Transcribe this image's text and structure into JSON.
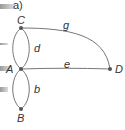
{
  "figure": {
    "part_label": "a)",
    "nodes": [
      {
        "id": "C",
        "label": "C"
      },
      {
        "id": "A",
        "label": "A"
      },
      {
        "id": "B",
        "label": "B"
      },
      {
        "id": "D",
        "label": "D"
      }
    ],
    "edges": [
      {
        "id": "g",
        "label": "g",
        "from": "C",
        "to": "D"
      },
      {
        "id": "d1",
        "label": "d",
        "from": "C",
        "to": "A"
      },
      {
        "id": "d2",
        "label": "",
        "from": "C",
        "to": "A"
      },
      {
        "id": "e",
        "label": "e",
        "from": "A",
        "to": "D"
      },
      {
        "id": "b1",
        "label": "b",
        "from": "A",
        "to": "B"
      },
      {
        "id": "b2",
        "label": "",
        "from": "A",
        "to": "B"
      }
    ],
    "colors": {
      "edge": "#777777",
      "node": "#555555",
      "text": "#333333"
    }
  }
}
